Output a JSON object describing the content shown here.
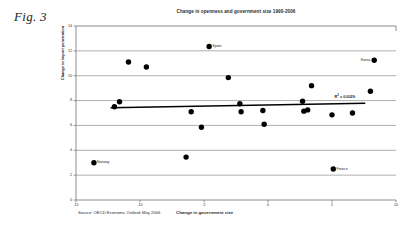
{
  "figure_label": "Fig. 3",
  "chart_data": {
    "type": "scatter",
    "title": "Change in openness and government size 1990-2006",
    "xlabel": "Change in government size",
    "ylabel": "Change in import penetration",
    "source": "Source: OECD Economic Outlook May 2006",
    "xlim": [
      -15,
      10
    ],
    "ylim": [
      0,
      14
    ],
    "xticks": [
      -15,
      -10,
      -5,
      0,
      5,
      10
    ],
    "yticks": [
      0,
      2,
      4,
      6,
      8,
      10,
      12,
      14
    ],
    "xtick_labels": [
      "-15",
      "-10",
      "-5",
      "0",
      "5",
      "10"
    ],
    "ytick_labels": [
      "0",
      "2",
      "4",
      "6",
      "8",
      "10",
      "12",
      "14"
    ],
    "grid": "horizontal",
    "legend": "none",
    "marker": {
      "shape": "circle",
      "color": "#000000",
      "size": 5.4
    },
    "points": [
      {
        "x": -13.6,
        "y": 3.0,
        "label": "Norway",
        "label_pos": "right"
      },
      {
        "x": -12.0,
        "y": 7.5,
        "label": "",
        "label_pos": "right"
      },
      {
        "x": -11.6,
        "y": 7.9,
        "label": "",
        "label_pos": "right"
      },
      {
        "x": -10.9,
        "y": 11.1,
        "label": "",
        "label_pos": "right"
      },
      {
        "x": -9.5,
        "y": 10.7,
        "label": "",
        "label_pos": "right"
      },
      {
        "x": -6.4,
        "y": 3.45,
        "label": "",
        "label_pos": "right"
      },
      {
        "x": -6.0,
        "y": 7.1,
        "label": "",
        "label_pos": "right"
      },
      {
        "x": -5.2,
        "y": 5.85,
        "label": "",
        "label_pos": "right"
      },
      {
        "x": -4.6,
        "y": 12.35,
        "label": "Spain",
        "label_pos": "right"
      },
      {
        "x": -3.1,
        "y": 9.85,
        "label": "",
        "label_pos": "right"
      },
      {
        "x": -2.2,
        "y": 7.75,
        "label": "",
        "label_pos": "right"
      },
      {
        "x": -2.1,
        "y": 7.1,
        "label": "",
        "label_pos": "right"
      },
      {
        "x": -0.4,
        "y": 7.2,
        "label": "",
        "label_pos": "right"
      },
      {
        "x": -0.3,
        "y": 6.1,
        "label": "",
        "label_pos": "right"
      },
      {
        "x": 2.7,
        "y": 7.95,
        "label": "",
        "label_pos": "right"
      },
      {
        "x": 2.8,
        "y": 7.15,
        "label": "",
        "label_pos": "right"
      },
      {
        "x": 3.1,
        "y": 7.25,
        "label": "",
        "label_pos": "right"
      },
      {
        "x": 3.4,
        "y": 9.2,
        "label": "",
        "label_pos": "right"
      },
      {
        "x": 5.1,
        "y": 2.5,
        "label": "France",
        "label_pos": "right"
      },
      {
        "x": 5.0,
        "y": 6.85,
        "label": "",
        "label_pos": "right"
      },
      {
        "x": 6.6,
        "y": 7.0,
        "label": "",
        "label_pos": "right"
      },
      {
        "x": 8.0,
        "y": 8.75,
        "label": "",
        "label_pos": "right"
      },
      {
        "x": 8.3,
        "y": 11.25,
        "label": "Korea",
        "label_pos": "left"
      }
    ],
    "trendline": {
      "x_start": -12.3,
      "y_start": 7.42,
      "x_end": 7.6,
      "y_end": 7.78,
      "color": "#000000"
    },
    "annotation": {
      "text_prefix": "R",
      "text_sup": "2",
      "text_suffix": " = 0.0029",
      "x": 5.2,
      "y": 8.45
    }
  }
}
